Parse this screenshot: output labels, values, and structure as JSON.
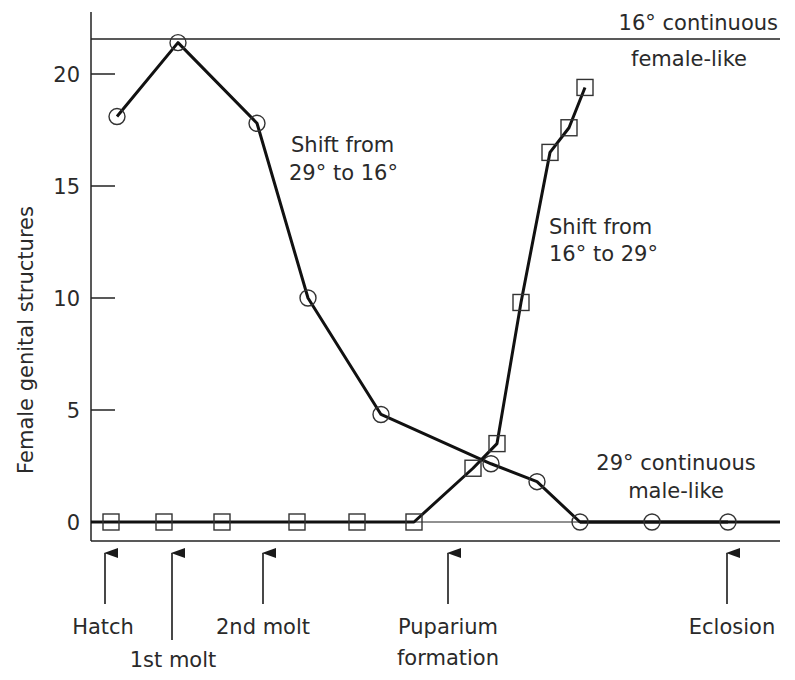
{
  "chart_data": {
    "type": "line",
    "title": "",
    "xlabel": "",
    "ylabel": "Female genital structures",
    "ylim": [
      0,
      22
    ],
    "yticks": [
      0,
      5,
      10,
      15,
      20
    ],
    "grid": false,
    "reference_lines": [
      {
        "name": "16° continuous",
        "label_line1": "16° continuous",
        "label_line2": "female-like",
        "value": 21.6
      },
      {
        "name": "29° continuous",
        "label_line1": "29° continuous",
        "label_line2": "male-like",
        "value": 0
      }
    ],
    "series": [
      {
        "name": "Shift from 29° to 16°",
        "label_line1": "Shift from",
        "label_line2": "29° to 16°",
        "marker": "circle",
        "x": [
          117,
          178,
          257,
          308,
          381,
          491,
          537,
          580,
          652,
          728
        ],
        "values": [
          18.1,
          21.4,
          17.8,
          10.0,
          4.8,
          2.6,
          1.8,
          0,
          0,
          0
        ]
      },
      {
        "name": "Shift from 16° to 29°",
        "label_line1": "Shift from",
        "label_line2": "16° to 29°",
        "marker": "square",
        "x": [
          111,
          164,
          222,
          297,
          357,
          414,
          473,
          497,
          521,
          550,
          569,
          585
        ],
        "values": [
          0,
          0,
          0,
          0,
          0,
          0,
          2.4,
          3.5,
          9.8,
          16.5,
          17.6,
          19.4
        ]
      }
    ],
    "developmental_stages": [
      {
        "label": "Hatch",
        "x": 105
      },
      {
        "label": "1st molt",
        "x": 172
      },
      {
        "label": "2nd molt",
        "x": 263
      },
      {
        "label": "Puparium formation",
        "label_line1": "Puparium",
        "label_line2": "formation",
        "x": 448
      },
      {
        "label": "Eclosion",
        "x": 727
      }
    ]
  },
  "yaxis": {
    "label": "Female genital structures",
    "ticks": [
      "0",
      "5",
      "10",
      "15",
      "20"
    ]
  },
  "annotations": {
    "ref_top_line1": "16° continuous",
    "ref_top_line2": "female-like",
    "ref_bottom_line1": "29° continuous",
    "ref_bottom_line2": "male-like",
    "circle_series_line1": "Shift from",
    "circle_series_line2": "29° to 16°",
    "square_series_line1": "Shift from",
    "square_series_line2": "16° to 29°"
  },
  "stages": {
    "hatch": "Hatch",
    "first_molt": "1st molt",
    "second_molt": "2nd molt",
    "puparium_line1": "Puparium",
    "puparium_line2": "formation",
    "eclosion": "Eclosion"
  }
}
